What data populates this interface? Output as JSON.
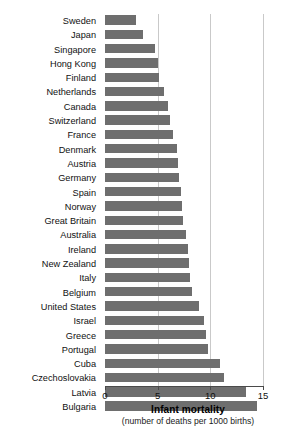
{
  "chart_data": {
    "type": "bar",
    "orientation": "horizontal",
    "title": "",
    "xlabel": "Infant mortality",
    "xlabel_sub": "(number of deaths per 1000 births)",
    "ylabel": "",
    "xlim": [
      0,
      15
    ],
    "xticks": [
      0,
      5,
      10,
      15
    ],
    "xtick_labels": [
      "0",
      "5",
      "10",
      "15"
    ],
    "grid": true,
    "grid_axis": "x",
    "legend": false,
    "bar_color": "#6e6e6e",
    "gridline_color": "#c9c9c9",
    "axis_color": "#4a4a4a",
    "categories": [
      "Sweden",
      "Japan",
      "Singapore",
      "Hong Kong",
      "Finland",
      "Netherlands",
      "Canada",
      "Switzerland",
      "France",
      "Denmark",
      "Austria",
      "Germany",
      "Spain",
      "Norway",
      "Great Britain",
      "Australia",
      "Ireland",
      "New Zealand",
      "Italy",
      "Belgium",
      "United States",
      "Israel",
      "Greece",
      "Portugal",
      "Cuba",
      "Czechoslovakia",
      "Latvia",
      "Bulgaria"
    ],
    "values": [
      2.9,
      3.6,
      4.7,
      5.0,
      5.1,
      5.6,
      6.0,
      6.2,
      6.5,
      6.8,
      6.9,
      7.0,
      7.2,
      7.3,
      7.4,
      7.7,
      7.9,
      8.0,
      8.1,
      8.3,
      8.9,
      9.4,
      9.6,
      9.8,
      10.9,
      11.3,
      13.4,
      14.4
    ]
  },
  "axis": {
    "title": "Infant mortality",
    "subtitle": "(number of deaths per 1000 births)"
  }
}
